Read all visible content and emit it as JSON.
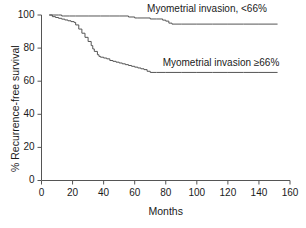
{
  "chart_data": {
    "type": "line",
    "title": "",
    "subtitle": "",
    "xlabel": "Months",
    "ylabel": "% Recurrence-free survival",
    "xlim": [
      0,
      160
    ],
    "ylim": [
      0,
      100
    ],
    "xticks": [
      "0",
      "20",
      "40",
      "60",
      "80",
      "100",
      "120",
      "140",
      "160"
    ],
    "yticks": [
      "0",
      "20",
      "40",
      "60",
      "80",
      "100"
    ],
    "grid": false,
    "legend_position": "inline-annotation",
    "line_color": "#555555",
    "axis_color": "#555555",
    "annotations": [
      {
        "name": "upper-curve-label",
        "text": "Myometrial invasion, <66%",
        "x_months": 72,
        "y_percent": 100
      },
      {
        "name": "lower-curve-label",
        "text": "Myometrial invasion ≥66%",
        "x_months": 82,
        "y_percent": 73
      }
    ],
    "series": [
      {
        "name": "Myometrial invasion, <66%",
        "step": "post",
        "x": [
          5,
          8,
          11,
          13,
          14,
          18,
          22,
          30,
          38,
          44,
          50,
          56,
          60,
          62,
          66,
          70,
          74,
          78,
          80,
          82,
          84,
          90,
          100,
          110,
          120,
          130,
          140,
          152
        ],
        "y": [
          100,
          100,
          100,
          99.4,
          99.4,
          99.4,
          99.4,
          99.4,
          99.4,
          99.4,
          99.4,
          98.8,
          98.2,
          98.2,
          98.2,
          97.6,
          97.6,
          96.9,
          96.3,
          95.1,
          94.5,
          94.5,
          94.5,
          94.5,
          94.5,
          94.5,
          94.5,
          94.5
        ]
      },
      {
        "name": "Myometrial invasion ≥66%",
        "step": "post",
        "x": [
          5,
          7,
          9,
          11,
          13,
          15,
          17,
          19,
          21,
          22,
          24,
          26,
          28,
          30,
          32,
          33,
          34,
          36,
          37,
          38,
          40,
          42,
          44,
          46,
          48,
          50,
          52,
          54,
          56,
          58,
          60,
          62,
          64,
          66,
          68,
          70,
          74,
          80,
          90,
          100,
          110,
          120,
          130,
          140,
          152
        ],
        "y": [
          100,
          99.0,
          98.5,
          98.0,
          97.5,
          97.0,
          96.5,
          96.0,
          95.5,
          94.0,
          91.5,
          89.0,
          86.5,
          84.0,
          81.5,
          79.5,
          78.0,
          76.0,
          75.0,
          74.5,
          74.0,
          73.5,
          72.5,
          72.0,
          71.5,
          71.0,
          70.5,
          70.0,
          69.5,
          69.0,
          68.5,
          68.0,
          67.5,
          67.0,
          66.0,
          65.3,
          65.3,
          65.3,
          65.3,
          65.3,
          65.3,
          65.3,
          65.3,
          65.3,
          65.3
        ]
      }
    ]
  },
  "axes": {
    "x_axis_name": "Months",
    "y_axis_name": "% Recurrence-free survival"
  }
}
